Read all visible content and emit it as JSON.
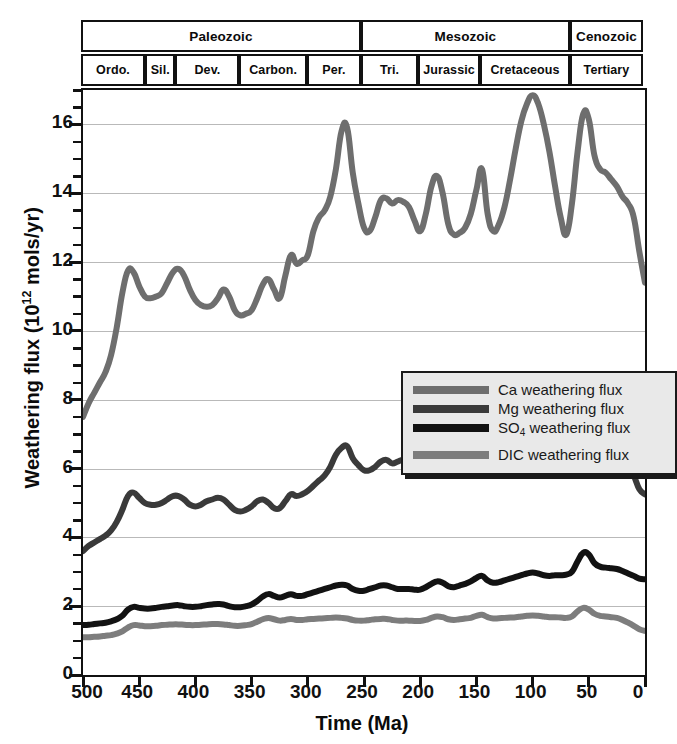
{
  "axes": {
    "x_title": "Time (Ma)",
    "y_title_pre": "Weathering flux (10",
    "y_title_sup": "12",
    "y_title_post": " mols/yr)"
  },
  "timescale": {
    "eras": [
      {
        "label": "Paleozoic",
        "start_ma": 500,
        "end_ma": 251
      },
      {
        "label": "Mesozoic",
        "start_ma": 251,
        "end_ma": 65
      },
      {
        "label": "Cenozoic",
        "start_ma": 65,
        "end_ma": 0
      }
    ],
    "periods": [
      {
        "label": "Ordo.",
        "start_ma": 500,
        "end_ma": 443
      },
      {
        "label": "Sil.",
        "start_ma": 443,
        "end_ma": 416
      },
      {
        "label": "Dev.",
        "start_ma": 416,
        "end_ma": 359
      },
      {
        "label": "Carbon.",
        "start_ma": 359,
        "end_ma": 299
      },
      {
        "label": "Per.",
        "start_ma": 299,
        "end_ma": 251
      },
      {
        "label": "Tri.",
        "start_ma": 251,
        "end_ma": 200
      },
      {
        "label": "Jurassic",
        "start_ma": 200,
        "end_ma": 145
      },
      {
        "label": "Cretaceous",
        "start_ma": 145,
        "end_ma": 65
      },
      {
        "label": "Tertiary",
        "start_ma": 65,
        "end_ma": 0
      }
    ]
  },
  "legend": {
    "items": [
      {
        "name": "ca-series",
        "label_pre": "Ca weathering flux",
        "sub": "",
        "label_post": "",
        "color": "#6e6e6e",
        "gap": false
      },
      {
        "name": "mg-series",
        "label_pre": "Mg weathering flux",
        "sub": "",
        "label_post": "",
        "color": "#3a3a3a",
        "gap": false
      },
      {
        "name": "so4-series",
        "label_pre": "SO",
        "sub": "4",
        "label_post": " weathering flux",
        "color": "#121212",
        "gap": false
      },
      {
        "name": "dic-series",
        "label_pre": "DIC weathering flux",
        "sub": "",
        "label_post": "",
        "color": "#7d7d7d",
        "gap": true
      }
    ]
  },
  "chart_data": {
    "type": "line",
    "title": "",
    "xlabel": "Time (Ma)",
    "ylabel": "Weathering flux (10^12 mols/yr)",
    "xlim": [
      500,
      0
    ],
    "xlim_reversed": true,
    "ylim": [
      0,
      17
    ],
    "grid": "horizontal",
    "legend_position": "center",
    "x_ticks_major": [
      500,
      450,
      400,
      350,
      300,
      250,
      200,
      150,
      100,
      50,
      0
    ],
    "x_tick_labels": [
      "500",
      "450",
      "400",
      "350",
      "300",
      "250",
      "200",
      "150",
      "100",
      "50",
      "0"
    ],
    "x_ticks_minor_step": 10,
    "y_ticks_major": [
      0,
      2,
      4,
      6,
      8,
      10,
      12,
      14,
      16
    ],
    "y_tick_labels": [
      "0",
      "2",
      "4",
      "6",
      "8",
      "10",
      "12",
      "14",
      "16"
    ],
    "y_ticks_minor_step": 0.5,
    "x": [
      500,
      495,
      490,
      485,
      480,
      475,
      470,
      465,
      460,
      455,
      450,
      445,
      440,
      435,
      430,
      425,
      420,
      415,
      410,
      405,
      400,
      395,
      390,
      385,
      380,
      375,
      370,
      365,
      360,
      355,
      350,
      345,
      340,
      335,
      330,
      325,
      320,
      315,
      310,
      305,
      300,
      295,
      290,
      285,
      280,
      275,
      270,
      265,
      260,
      255,
      250,
      245,
      240,
      235,
      230,
      225,
      220,
      215,
      210,
      205,
      200,
      195,
      190,
      185,
      180,
      175,
      170,
      165,
      160,
      155,
      150,
      145,
      140,
      135,
      130,
      125,
      120,
      115,
      110,
      105,
      100,
      95,
      90,
      85,
      80,
      75,
      70,
      65,
      60,
      55,
      50,
      45,
      40,
      35,
      30,
      25,
      20,
      15,
      10,
      5,
      0
    ],
    "series": [
      {
        "name": "Ca weathering flux",
        "color": "#6e6e6e",
        "width": 6,
        "values": [
          7.5,
          7.9,
          8.2,
          8.5,
          8.8,
          9.3,
          10.1,
          11.1,
          11.75,
          11.7,
          11.3,
          11.0,
          10.95,
          11.0,
          11.1,
          11.4,
          11.7,
          11.8,
          11.6,
          11.2,
          10.9,
          10.75,
          10.7,
          10.75,
          10.95,
          11.2,
          11.0,
          10.6,
          10.45,
          10.5,
          10.6,
          10.95,
          11.35,
          11.5,
          11.2,
          10.95,
          11.6,
          12.2,
          11.95,
          12.05,
          12.2,
          12.9,
          13.3,
          13.5,
          13.9,
          14.7,
          15.8,
          15.9,
          14.6,
          13.7,
          13.0,
          12.9,
          13.3,
          13.8,
          13.85,
          13.7,
          13.8,
          13.75,
          13.6,
          13.2,
          12.9,
          13.4,
          14.2,
          14.5,
          14.0,
          13.1,
          12.8,
          12.85,
          13.0,
          13.4,
          14.1,
          14.7,
          13.4,
          12.9,
          13.1,
          13.6,
          14.4,
          15.3,
          16.1,
          16.6,
          16.85,
          16.6,
          16.0,
          15.2,
          14.2,
          13.3,
          12.8,
          13.7,
          15.2,
          16.3,
          16.15,
          15.1,
          14.7,
          14.6,
          14.4,
          14.2,
          13.9,
          13.7,
          13.3,
          12.3,
          11.4
        ]
      },
      {
        "name": "Mg weathering flux",
        "color": "#3a3a3a",
        "width": 6,
        "values": [
          3.6,
          3.75,
          3.85,
          3.95,
          4.05,
          4.2,
          4.45,
          4.8,
          5.2,
          5.3,
          5.15,
          5.0,
          4.95,
          4.95,
          5.0,
          5.1,
          5.2,
          5.2,
          5.1,
          4.95,
          4.9,
          4.95,
          5.05,
          5.1,
          5.15,
          5.1,
          4.95,
          4.8,
          4.75,
          4.8,
          4.9,
          5.05,
          5.1,
          5.0,
          4.85,
          4.85,
          5.05,
          5.25,
          5.2,
          5.25,
          5.35,
          5.5,
          5.65,
          5.8,
          6.05,
          6.4,
          6.6,
          6.65,
          6.3,
          6.1,
          5.95,
          5.95,
          6.05,
          6.2,
          6.25,
          6.15,
          6.2,
          6.25,
          6.15,
          6.05,
          5.95,
          6.1,
          6.3,
          6.4,
          6.25,
          6.0,
          5.9,
          5.95,
          6.05,
          6.15,
          6.4,
          6.5,
          6.0,
          5.85,
          5.95,
          6.15,
          6.5,
          6.9,
          7.35,
          7.7,
          7.85,
          7.75,
          7.5,
          7.2,
          6.85,
          6.5,
          6.2,
          6.35,
          6.85,
          7.2,
          7.15,
          6.85,
          6.6,
          6.5,
          6.45,
          6.4,
          6.3,
          6.1,
          5.8,
          5.4,
          5.25
        ]
      },
      {
        "name": "SO4 weathering flux",
        "color": "#121212",
        "width": 6,
        "values": [
          1.45,
          1.46,
          1.48,
          1.5,
          1.52,
          1.56,
          1.62,
          1.72,
          1.9,
          1.98,
          1.95,
          1.93,
          1.93,
          1.95,
          1.98,
          2.0,
          2.02,
          2.03,
          2.0,
          1.98,
          1.98,
          2.0,
          2.03,
          2.05,
          2.06,
          2.05,
          2.0,
          1.97,
          1.97,
          2.0,
          2.05,
          2.15,
          2.28,
          2.35,
          2.3,
          2.25,
          2.3,
          2.35,
          2.3,
          2.3,
          2.35,
          2.4,
          2.45,
          2.5,
          2.55,
          2.6,
          2.62,
          2.6,
          2.5,
          2.45,
          2.45,
          2.5,
          2.55,
          2.6,
          2.6,
          2.55,
          2.5,
          2.5,
          2.5,
          2.48,
          2.48,
          2.55,
          2.65,
          2.72,
          2.68,
          2.58,
          2.55,
          2.6,
          2.65,
          2.72,
          2.82,
          2.88,
          2.75,
          2.68,
          2.7,
          2.75,
          2.8,
          2.85,
          2.9,
          2.95,
          2.98,
          2.95,
          2.9,
          2.88,
          2.9,
          2.9,
          2.92,
          3.0,
          3.3,
          3.55,
          3.5,
          3.25,
          3.15,
          3.12,
          3.1,
          3.08,
          3.02,
          2.95,
          2.88,
          2.8,
          2.78
        ]
      },
      {
        "name": "DIC weathering flux",
        "color": "#7d7d7d",
        "width": 6,
        "values": [
          1.1,
          1.1,
          1.11,
          1.12,
          1.14,
          1.16,
          1.2,
          1.27,
          1.38,
          1.45,
          1.44,
          1.42,
          1.42,
          1.43,
          1.45,
          1.46,
          1.47,
          1.47,
          1.46,
          1.45,
          1.45,
          1.46,
          1.47,
          1.48,
          1.48,
          1.47,
          1.45,
          1.43,
          1.43,
          1.45,
          1.48,
          1.55,
          1.62,
          1.66,
          1.62,
          1.58,
          1.6,
          1.63,
          1.6,
          1.6,
          1.62,
          1.63,
          1.64,
          1.65,
          1.66,
          1.67,
          1.66,
          1.64,
          1.6,
          1.58,
          1.58,
          1.6,
          1.62,
          1.63,
          1.63,
          1.6,
          1.58,
          1.58,
          1.58,
          1.57,
          1.57,
          1.6,
          1.66,
          1.7,
          1.68,
          1.62,
          1.6,
          1.62,
          1.64,
          1.66,
          1.72,
          1.75,
          1.68,
          1.64,
          1.65,
          1.66,
          1.67,
          1.68,
          1.7,
          1.72,
          1.73,
          1.72,
          1.7,
          1.68,
          1.68,
          1.67,
          1.66,
          1.7,
          1.85,
          1.95,
          1.9,
          1.78,
          1.72,
          1.7,
          1.68,
          1.66,
          1.6,
          1.52,
          1.43,
          1.33,
          1.28
        ]
      }
    ]
  }
}
